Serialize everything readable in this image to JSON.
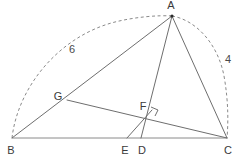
{
  "figure": {
    "background_color": "#ffffff",
    "line_color": "#6e6e6e",
    "dash_color": "#8a8a8a",
    "label_color": "#3a3a3a",
    "width": 240,
    "height": 162
  },
  "points": {
    "A": {
      "label": "A",
      "x": 172,
      "y": 16,
      "label_x": 171,
      "label_y": 6
    },
    "B": {
      "label": "B",
      "x": 12,
      "y": 138,
      "label_x": 11,
      "label_y": 151
    },
    "C": {
      "label": "C",
      "x": 227,
      "y": 138,
      "label_x": 228,
      "label_y": 151
    },
    "D": {
      "label": "D",
      "x": 141,
      "y": 138,
      "label_x": 142,
      "label_y": 151
    },
    "E": {
      "label": "E",
      "x": 127,
      "y": 138,
      "label_x": 125,
      "label_y": 151
    },
    "F": {
      "label": "F",
      "x": 150,
      "y": 114,
      "label_x": 143,
      "label_y": 107
    },
    "G": {
      "label": "G",
      "x": 67,
      "y": 100,
      "label_x": 58,
      "label_y": 97
    }
  },
  "segments": [
    {
      "name": "side-BC",
      "from": "B",
      "to": "C",
      "style": "solid"
    },
    {
      "name": "side-AB",
      "from": "A",
      "to": "B",
      "style": "solid"
    },
    {
      "name": "side-AC",
      "from": "A",
      "to": "C",
      "style": "solid"
    },
    {
      "name": "cevian-AD",
      "from": "A",
      "to": "D",
      "style": "solid"
    },
    {
      "name": "segment-GC",
      "from": "G",
      "to": "C",
      "style": "solid"
    },
    {
      "name": "segment-EF",
      "from": "E",
      "to": "F",
      "style": "solid"
    }
  ],
  "arcs": [
    {
      "name": "arc-BA",
      "from": "B",
      "to": "A",
      "style": "dashed",
      "measure_label": "6",
      "label_x": 72,
      "label_y": 50
    },
    {
      "name": "arc-AC",
      "from": "A",
      "to": "C",
      "style": "dashed",
      "measure_label": "4",
      "label_x": 228,
      "label_y": 60
    }
  ],
  "markers": {
    "right_angle": {
      "name": "right-angle-at-F",
      "at": "F",
      "x": 152,
      "y": 108,
      "size": 7
    },
    "vertex_dot": {
      "at": "A",
      "x": 172,
      "y": 16,
      "r": 1.6
    }
  },
  "measures": {
    "ab_length": "6",
    "ac_length": "4"
  }
}
